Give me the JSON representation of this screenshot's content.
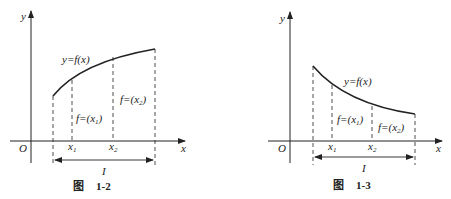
{
  "figures": [
    {
      "id": "fig-1-2",
      "caption_char": "图",
      "caption_num": "1-2",
      "curve_label": "y=f(x)",
      "axis_x": "x",
      "axis_y": "y",
      "origin": "O",
      "x1": "x",
      "x1_sub": "1",
      "x2": "x",
      "x2_sub": "2",
      "interval": "I",
      "f1_label": "f=(x",
      "f1_sub": "1",
      "f2_label": "f=(x",
      "f2_sub": "2",
      "close_paren": ")",
      "trend": "increasing"
    },
    {
      "id": "fig-1-3",
      "caption_char": "图",
      "caption_num": "1-3",
      "curve_label": "y=f(x)",
      "axis_x": "x",
      "axis_y": "y",
      "origin": "O",
      "x1": "x",
      "x1_sub": "1",
      "x2": "x",
      "x2_sub": "2",
      "interval": "I",
      "f1_label": "f=(x",
      "f1_sub": "1",
      "f2_label": "f=(x",
      "f2_sub": "2",
      "close_paren": ")",
      "trend": "decreasing"
    }
  ],
  "colors": {
    "stroke": "#222222",
    "background": "#ffffff"
  }
}
